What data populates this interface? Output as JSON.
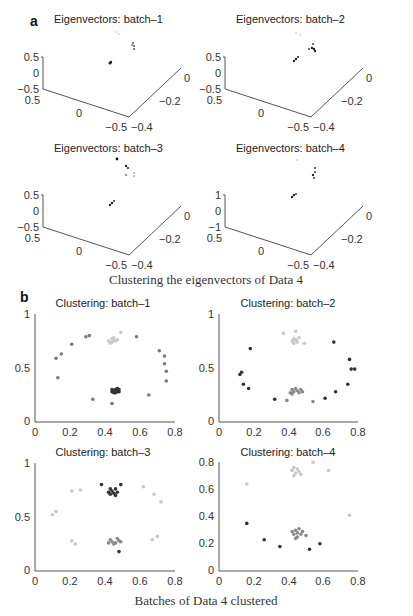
{
  "figure": {
    "panel_a": {
      "letter": "a",
      "caption": "Clustering the eigenvectors of Data 4",
      "subplots": [
        {
          "title": "Eigenvectors: batch–1",
          "z_ticks": [
            "0.5",
            "0",
            "−0.5"
          ],
          "x_ticks": [
            "0.5",
            "0",
            "−0.5"
          ],
          "y_ticks": [
            "−0.4",
            "−0.2",
            "0"
          ]
        },
        {
          "title": "Eigenvectors: batch–2",
          "z_ticks": [
            "0.5",
            "0",
            "−0.5"
          ],
          "x_ticks": [
            "0.5",
            "0",
            "−0.5"
          ],
          "y_ticks": [
            "−0.4",
            "−0.2",
            "0"
          ]
        },
        {
          "title": "Eigenvectors: batch–3",
          "z_ticks": [
            "0.5",
            "0",
            "−0.5"
          ],
          "x_ticks": [
            "0.5",
            "0",
            "−0.5"
          ],
          "y_ticks": [
            "−0.4",
            "−0.2",
            "0"
          ]
        },
        {
          "title": "Eigenvectors: batch–4",
          "z_ticks": [
            "1",
            "0",
            "−1"
          ],
          "x_ticks": [
            "0.5",
            "0",
            "−0.5"
          ],
          "y_ticks": [
            "−0.4",
            "−0.2",
            "0"
          ]
        }
      ]
    },
    "panel_b": {
      "letter": "b",
      "caption": "Batches of Data 4 clustered",
      "subplots": [
        {
          "title": "Clustering: batch–1",
          "x_ticks": [
            "0",
            "0.2",
            "0.4",
            "0.6",
            "0.8"
          ],
          "y_ticks": [
            "0",
            "0.5",
            "1"
          ]
        },
        {
          "title": "Clustering: batch–2",
          "x_ticks": [
            "0",
            "0.2",
            "0.4",
            "0.6",
            "0.8"
          ],
          "y_ticks": [
            "0",
            "0.5",
            "1"
          ]
        },
        {
          "title": "Clustering: batch–3",
          "x_ticks": [
            "0",
            "0.2",
            "0.4",
            "0.6",
            "0.8"
          ],
          "y_ticks": [
            "0",
            "0.5",
            "1"
          ]
        },
        {
          "title": "Clustering: batch–4",
          "x_ticks": [
            "0",
            "0.2",
            "0.4",
            "0.6",
            "0.8"
          ],
          "y_ticks": [
            "0",
            "0.2",
            "0.4",
            "0.6",
            "0.8"
          ]
        }
      ]
    },
    "colors": {
      "cluster_light": "#c8c8c8",
      "cluster_mid": "#8a8a8a",
      "cluster_dark": "#333333",
      "axis": "#555555"
    }
  },
  "chart_data": [
    {
      "type": "scatter",
      "title": "Clustering: batch–1",
      "xlim": [
        0,
        0.8
      ],
      "ylim": [
        0,
        1
      ],
      "series": [
        {
          "name": "light cluster",
          "color": "#c8c8c8",
          "points": [
            [
              0.42,
              0.75
            ],
            [
              0.44,
              0.77
            ],
            [
              0.45,
              0.78
            ],
            [
              0.46,
              0.75
            ],
            [
              0.44,
              0.74
            ],
            [
              0.47,
              0.76
            ],
            [
              0.43,
              0.73
            ],
            [
              0.45,
              0.76
            ],
            [
              0.49,
              0.83
            ]
          ]
        },
        {
          "name": "dark cluster",
          "color": "#333333",
          "points": [
            [
              0.44,
              0.28
            ],
            [
              0.45,
              0.29
            ],
            [
              0.46,
              0.3
            ],
            [
              0.47,
              0.28
            ],
            [
              0.48,
              0.3
            ],
            [
              0.45,
              0.27
            ],
            [
              0.47,
              0.31
            ],
            [
              0.46,
              0.27
            ],
            [
              0.44,
              0.3
            ],
            [
              0.48,
              0.28
            ]
          ]
        },
        {
          "name": "mid ring",
          "color": "#7a7a7a",
          "points": [
            [
              0.12,
              0.59
            ],
            [
              0.15,
              0.63
            ],
            [
              0.21,
              0.72
            ],
            [
              0.29,
              0.79
            ],
            [
              0.31,
              0.8
            ],
            [
              0.13,
              0.41
            ],
            [
              0.58,
              0.79
            ],
            [
              0.71,
              0.66
            ],
            [
              0.74,
              0.61
            ],
            [
              0.74,
              0.54
            ],
            [
              0.75,
              0.47
            ],
            [
              0.75,
              0.38
            ],
            [
              0.65,
              0.25
            ],
            [
              0.33,
              0.21
            ],
            [
              0.44,
              0.17
            ]
          ]
        }
      ]
    },
    {
      "type": "scatter",
      "title": "Clustering: batch–2",
      "xlim": [
        0,
        0.8
      ],
      "ylim": [
        0,
        1
      ],
      "series": [
        {
          "name": "light cluster",
          "color": "#c8c8c8",
          "points": [
            [
              0.42,
              0.75
            ],
            [
              0.43,
              0.77
            ],
            [
              0.44,
              0.76
            ],
            [
              0.45,
              0.74
            ],
            [
              0.43,
              0.73
            ],
            [
              0.46,
              0.78
            ],
            [
              0.37,
              0.82
            ],
            [
              0.44,
              0.84
            ],
            [
              0.49,
              0.73
            ]
          ]
        },
        {
          "name": "mid cluster",
          "color": "#8a8a8a",
          "points": [
            [
              0.41,
              0.27
            ],
            [
              0.42,
              0.3
            ],
            [
              0.43,
              0.28
            ],
            [
              0.44,
              0.31
            ],
            [
              0.45,
              0.29
            ],
            [
              0.46,
              0.27
            ],
            [
              0.47,
              0.3
            ],
            [
              0.48,
              0.28
            ],
            [
              0.42,
              0.26
            ],
            [
              0.39,
              0.2
            ],
            [
              0.54,
              0.19
            ]
          ]
        },
        {
          "name": "dark ring",
          "color": "#333333",
          "points": [
            [
              0.18,
              0.68
            ],
            [
              0.12,
              0.44
            ],
            [
              0.13,
              0.46
            ],
            [
              0.14,
              0.35
            ],
            [
              0.17,
              0.31
            ],
            [
              0.32,
              0.21
            ],
            [
              0.61,
              0.22
            ],
            [
              0.66,
              0.74
            ],
            [
              0.75,
              0.58
            ],
            [
              0.76,
              0.49
            ],
            [
              0.78,
              0.49
            ],
            [
              0.74,
              0.35
            ],
            [
              0.67,
              0.28
            ]
          ]
        }
      ]
    },
    {
      "type": "scatter",
      "title": "Clustering: batch–3",
      "xlim": [
        0,
        0.8
      ],
      "ylim": [
        0,
        1
      ],
      "series": [
        {
          "name": "dark cluster",
          "color": "#333333",
          "points": [
            [
              0.42,
              0.73
            ],
            [
              0.43,
              0.76
            ],
            [
              0.44,
              0.74
            ],
            [
              0.45,
              0.72
            ],
            [
              0.46,
              0.76
            ],
            [
              0.47,
              0.73
            ],
            [
              0.43,
              0.71
            ],
            [
              0.46,
              0.7
            ],
            [
              0.38,
              0.8
            ],
            [
              0.49,
              0.8
            ],
            [
              0.48,
              0.18
            ]
          ]
        },
        {
          "name": "mid cluster",
          "color": "#8a8a8a",
          "points": [
            [
              0.42,
              0.26
            ],
            [
              0.43,
              0.29
            ],
            [
              0.44,
              0.27
            ],
            [
              0.46,
              0.26
            ],
            [
              0.47,
              0.3
            ],
            [
              0.48,
              0.28
            ],
            [
              0.45,
              0.25
            ],
            [
              0.49,
              0.27
            ]
          ]
        },
        {
          "name": "light ring",
          "color": "#c8c8c8",
          "points": [
            [
              0.21,
              0.74
            ],
            [
              0.26,
              0.75
            ],
            [
              0.1,
              0.52
            ],
            [
              0.12,
              0.55
            ],
            [
              0.21,
              0.28
            ],
            [
              0.23,
              0.25
            ],
            [
              0.62,
              0.78
            ],
            [
              0.68,
              0.71
            ],
            [
              0.72,
              0.64
            ],
            [
              0.67,
              0.29
            ],
            [
              0.7,
              0.32
            ]
          ]
        }
      ]
    },
    {
      "type": "scatter",
      "title": "Clustering: batch–4",
      "xlim": [
        0,
        0.8
      ],
      "ylim": [
        0,
        0.8
      ],
      "series": [
        {
          "name": "light cluster",
          "color": "#c8c8c8",
          "points": [
            [
              0.42,
              0.74
            ],
            [
              0.43,
              0.76
            ],
            [
              0.44,
              0.72
            ],
            [
              0.45,
              0.75
            ],
            [
              0.46,
              0.73
            ],
            [
              0.47,
              0.71
            ],
            [
              0.43,
              0.7
            ],
            [
              0.54,
              0.8
            ],
            [
              0.63,
              0.74
            ],
            [
              0.16,
              0.64
            ],
            [
              0.75,
              0.41
            ]
          ]
        },
        {
          "name": "mid cluster",
          "color": "#8a8a8a",
          "points": [
            [
              0.42,
              0.29
            ],
            [
              0.43,
              0.27
            ],
            [
              0.44,
              0.3
            ],
            [
              0.45,
              0.28
            ],
            [
              0.46,
              0.31
            ],
            [
              0.47,
              0.27
            ],
            [
              0.48,
              0.29
            ],
            [
              0.45,
              0.25
            ],
            [
              0.44,
              0.24
            ],
            [
              0.5,
              0.26
            ]
          ]
        },
        {
          "name": "dark ring",
          "color": "#333333",
          "points": [
            [
              0.16,
              0.35
            ],
            [
              0.26,
              0.23
            ],
            [
              0.35,
              0.18
            ],
            [
              0.52,
              0.16
            ],
            [
              0.58,
              0.2
            ]
          ]
        }
      ]
    }
  ]
}
